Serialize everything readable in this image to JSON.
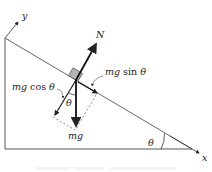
{
  "diagram": {
    "type": "free-body-diagram-incline",
    "axes": {
      "x_label": "x",
      "y_label": "y"
    },
    "forces": [
      {
        "name": "normal",
        "label": "N"
      },
      {
        "name": "weight",
        "label": "mg"
      },
      {
        "name": "parallel-component",
        "label_italic": "mg",
        "label_func": " sin ",
        "label_angle": "θ"
      },
      {
        "name": "perpendicular-component",
        "label_italic": "mg",
        "label_func": " cos ",
        "label_angle": "θ"
      }
    ],
    "angles": {
      "incline_angle": "θ",
      "weight_angle": "θ"
    },
    "colors": {
      "line": "#222222",
      "dashed": "#666666",
      "block": "#b0b0b0"
    }
  }
}
